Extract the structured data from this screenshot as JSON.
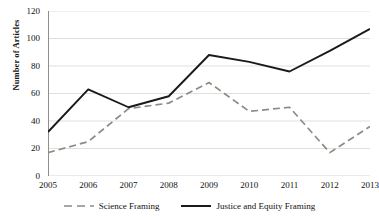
{
  "chart_data": {
    "type": "line",
    "title": "",
    "xlabel": "",
    "ylabel": "Number of Articles",
    "categories": [
      "2005",
      "2006",
      "2007",
      "2008",
      "2009",
      "2010",
      "2011",
      "2012",
      "2013"
    ],
    "x": [
      2005,
      2006,
      2007,
      2008,
      2009,
      2010,
      2011,
      2012,
      2013
    ],
    "ylim": [
      0,
      120
    ],
    "ytick_values": [
      0,
      20,
      40,
      60,
      80,
      100,
      120
    ],
    "ytick_labels": [
      "0",
      "20",
      "40",
      "60",
      "80",
      "100",
      "120"
    ],
    "grid": "horizontal",
    "legend_position": "bottom-center",
    "series": [
      {
        "name": "Science Framing",
        "style": "dashed",
        "color": "#8c8c85",
        "values": [
          17,
          25,
          49,
          53,
          68,
          47,
          50,
          17,
          36
        ]
      },
      {
        "name": "Justice and Equity Framing",
        "style": "solid",
        "color": "#1a1a1a",
        "values": [
          32,
          63,
          50,
          58,
          88,
          83,
          76,
          91,
          107
        ]
      }
    ]
  },
  "axes": {
    "y_axis_title": "Number of Articles",
    "y_tick_labels": [
      "120",
      "100",
      "80",
      "60",
      "40",
      "20",
      "0"
    ],
    "x_tick_labels": [
      "2005",
      "2006",
      "2007",
      "2008",
      "2009",
      "2010",
      "2011",
      "2012",
      "2013"
    ]
  },
  "legend": {
    "items": [
      {
        "label": "Science Framing",
        "style": "dashed",
        "color": "#8c8c85"
      },
      {
        "label": "Justice and Equity Framing",
        "style": "solid",
        "color": "#1a1a1a"
      }
    ]
  },
  "colors": {
    "science_framing": "#8c8c85",
    "justice_equity_framing": "#1a1a1a",
    "grid": "#d7d7d2",
    "axis": "#8f8f88",
    "background": "#ffffff"
  }
}
